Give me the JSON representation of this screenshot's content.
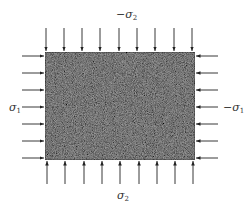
{
  "diagram": {
    "plate": {
      "x": 45,
      "y": 52,
      "width": 150,
      "height": 108,
      "fill": "#8c8c8c",
      "texture": "speckled-granular"
    },
    "labels": {
      "top": {
        "prefix": "−σ",
        "sub": "2"
      },
      "bottom": {
        "prefix": "σ",
        "sub": "2"
      },
      "left": {
        "prefix": "σ",
        "sub": "1"
      },
      "right": {
        "prefix": "−σ",
        "sub": "1"
      }
    },
    "arrows": {
      "top_x": [
        46,
        64,
        82,
        100,
        119,
        137,
        155,
        174,
        192
      ],
      "bottom_x": [
        47,
        65,
        84,
        102,
        120,
        139,
        157,
        175,
        193
      ],
      "left_y": [
        56,
        73,
        90,
        107,
        124,
        141,
        158
      ],
      "right_y": [
        56,
        73,
        90,
        107,
        124,
        141,
        158
      ],
      "color": "#222222"
    }
  }
}
